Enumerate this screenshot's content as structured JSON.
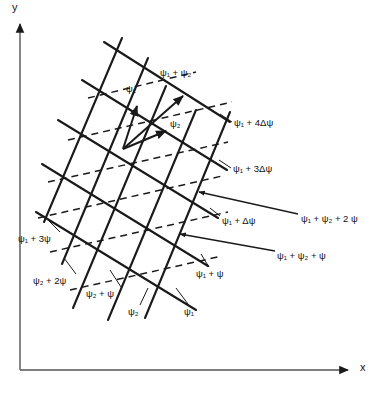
{
  "figure": {
    "background_color": "#ffffff",
    "line_color": "#1a1a1a",
    "text_color": "#111111"
  },
  "axes": {
    "x_label": "x",
    "y_label": "y",
    "origin": {
      "x": 20,
      "y": 370
    },
    "x_tip": {
      "x": 355,
      "y": 370
    },
    "y_tip": {
      "x": 20,
      "y": 18
    }
  },
  "vectors": [
    {
      "name": "psi-1-vector",
      "label": "ψ₁",
      "label_text": "ψ",
      "label_sub": "1",
      "from": {
        "x": 123,
        "y": 149
      },
      "to": {
        "x": 137,
        "y": 104
      },
      "label_pos": {
        "x": 126,
        "y": 88
      }
    },
    {
      "name": "psi-2-vector",
      "label": "ψ₂",
      "label_text": "ψ",
      "label_sub": "2",
      "from": {
        "x": 123,
        "y": 149
      },
      "to": {
        "x": 169,
        "y": 130
      },
      "label_pos": {
        "x": 170,
        "y": 123
      }
    },
    {
      "name": "psi-1-plus-psi-2-vector",
      "label": "ψ₁ + ψ₂",
      "from": {
        "x": 123,
        "y": 149
      },
      "to": {
        "x": 185,
        "y": 94
      },
      "label_pos": {
        "x": 160,
        "y": 72
      }
    }
  ],
  "labels": [
    {
      "name": "label-psi1-plus-4-delta-psi",
      "text": "ψ₁ + 4Δψ",
      "pos": {
        "x": 234,
        "y": 122
      },
      "leader": {
        "from": {
          "x": 232,
          "y": 126
        },
        "to": {
          "x": 218,
          "y": 118
        }
      }
    },
    {
      "name": "label-psi1-plus-3-delta-psi",
      "text": "ψ₁ + 3Δψ",
      "pos": {
        "x": 233,
        "y": 168
      },
      "leader": {
        "from": {
          "x": 231,
          "y": 172
        },
        "to": {
          "x": 218,
          "y": 166
        }
      }
    },
    {
      "name": "label-psi1-plus-delta-psi",
      "text": "ψ₁ +  Δψ",
      "pos": {
        "x": 222,
        "y": 220
      },
      "leader": {
        "from": {
          "x": 221,
          "y": 222
        },
        "to": {
          "x": 211,
          "y": 213
        }
      }
    },
    {
      "name": "label-psi1-plus-psi2-plus-2psi",
      "text": "ψ₁ + ψ₂ + 2 ψ",
      "pos": {
        "x": 301,
        "y": 218
      },
      "arrow_to": {
        "x": 192,
        "y": 189
      }
    },
    {
      "name": "label-psi1-plus-psi2-plus-psi",
      "text": "ψ₁ + ψ₂ + ψ",
      "pos": {
        "x": 277,
        "y": 255
      },
      "arrow_to": {
        "x": 172,
        "y": 232
      }
    },
    {
      "name": "label-psi1-plus-3psi",
      "text": "ψ₁ + 3ψ",
      "pos": {
        "x": 18,
        "y": 238
      },
      "leader": {
        "from": {
          "x": 60,
          "y": 236
        },
        "to": {
          "x": 44,
          "y": 225
        }
      }
    },
    {
      "name": "label-psi2-plus-2psi",
      "text": "ψ₂ + 2ψ",
      "pos": {
        "x": 36,
        "y": 280
      },
      "leader": {
        "from": {
          "x": 74,
          "y": 278
        },
        "to": {
          "x": 62,
          "y": 265
        }
      }
    },
    {
      "name": "label-psi2-plus-psi",
      "text": "ψ₂ + ψ",
      "pos": {
        "x": 88,
        "y": 293
      },
      "leader": {
        "from": {
          "x": 120,
          "y": 290
        },
        "to": {
          "x": 108,
          "y": 276
        }
      }
    },
    {
      "name": "label-psi2",
      "text": "ψ₂",
      "pos": {
        "x": 129,
        "y": 311
      },
      "leader": {
        "from": {
          "x": 139,
          "y": 308
        },
        "to": {
          "x": 145,
          "y": 292
        }
      }
    },
    {
      "name": "label-psi1",
      "text": "ψ₁",
      "pos": {
        "x": 186,
        "y": 311
      },
      "leader": {
        "from": {
          "x": 188,
          "y": 307
        },
        "to": {
          "x": 176,
          "y": 292
        }
      }
    },
    {
      "name": "label-psi1-plus-psi",
      "text": "ψ₁ + ψ",
      "pos": {
        "x": 197,
        "y": 273
      },
      "leader": {
        "from": {
          "x": 208,
          "y": 270
        },
        "to": {
          "x": 200,
          "y": 258
        }
      }
    }
  ],
  "lattice": {
    "family_a_name": "steep-solid-lines",
    "family_b_name": "shallow-solid-lines",
    "family_c_name": "dashed-lines",
    "family_a_count": 5,
    "family_b_count": 5,
    "family_c_count": 6,
    "dash_pattern": "7 5"
  }
}
